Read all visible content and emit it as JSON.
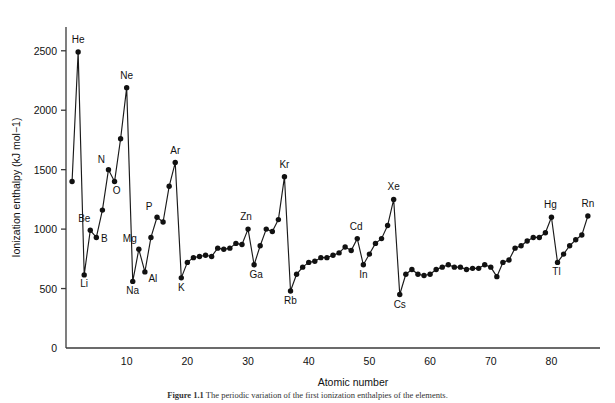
{
  "figure": {
    "caption_label": "Figure 1.1",
    "caption_text": "The periodic variation of the first ionization enthalpies of the elements."
  },
  "chart_data": {
    "type": "line",
    "title": "",
    "xlabel": "Atomic number",
    "ylabel": "Ionization enthalpy (kJ mol−1)",
    "xlim": [
      0,
      88
    ],
    "ylim": [
      0,
      2700
    ],
    "grid": false,
    "legend": "none",
    "xticks": [
      10,
      20,
      30,
      40,
      50,
      60,
      70,
      80
    ],
    "yticks": [
      0,
      500,
      1000,
      1500,
      2000,
      2500
    ],
    "y_origin_label": "0",
    "x": [
      1,
      2,
      3,
      4,
      5,
      6,
      7,
      8,
      9,
      10,
      11,
      12,
      13,
      14,
      15,
      16,
      17,
      18,
      19,
      20,
      21,
      22,
      23,
      24,
      25,
      26,
      27,
      28,
      29,
      30,
      31,
      32,
      33,
      34,
      35,
      36,
      37,
      38,
      39,
      40,
      41,
      42,
      43,
      44,
      45,
      46,
      47,
      48,
      49,
      50,
      51,
      52,
      53,
      54,
      55,
      56,
      57,
      58,
      59,
      60,
      61,
      62,
      63,
      64,
      65,
      66,
      67,
      68,
      69,
      70,
      71,
      72,
      73,
      74,
      75,
      76,
      77,
      78,
      79,
      80,
      81,
      82,
      83,
      84,
      85,
      86
    ],
    "values": [
      1400,
      2490,
      615,
      990,
      930,
      1160,
      1500,
      1400,
      1760,
      2190,
      560,
      830,
      640,
      930,
      1100,
      1060,
      1360,
      1560,
      590,
      720,
      760,
      770,
      780,
      770,
      840,
      830,
      840,
      880,
      870,
      1000,
      700,
      860,
      1000,
      980,
      1080,
      1440,
      480,
      620,
      680,
      720,
      730,
      760,
      760,
      780,
      800,
      850,
      820,
      920,
      700,
      790,
      880,
      920,
      1030,
      1250,
      450,
      620,
      660,
      620,
      610,
      620,
      660,
      680,
      700,
      680,
      680,
      660,
      670,
      670,
      700,
      680,
      600,
      720,
      740,
      840,
      860,
      900,
      930,
      930,
      970,
      1100,
      720,
      790,
      860,
      910,
      950,
      1110
    ],
    "series_name": "First ionization enthalpy",
    "point_labels": [
      {
        "x": 2,
        "text": "He"
      },
      {
        "x": 3,
        "text": "Li"
      },
      {
        "x": 4,
        "text": "Be"
      },
      {
        "x": 5,
        "text": "B"
      },
      {
        "x": 7,
        "text": "N"
      },
      {
        "x": 8,
        "text": "O"
      },
      {
        "x": 10,
        "text": "Ne"
      },
      {
        "x": 11,
        "text": "Na"
      },
      {
        "x": 12,
        "text": "Mg"
      },
      {
        "x": 13,
        "text": "Al"
      },
      {
        "x": 15,
        "text": "P"
      },
      {
        "x": 18,
        "text": "Ar"
      },
      {
        "x": 19,
        "text": "K"
      },
      {
        "x": 30,
        "text": "Zn"
      },
      {
        "x": 31,
        "text": "Ga"
      },
      {
        "x": 36,
        "text": "Kr"
      },
      {
        "x": 37,
        "text": "Rb"
      },
      {
        "x": 48,
        "text": "Cd"
      },
      {
        "x": 49,
        "text": "In"
      },
      {
        "x": 54,
        "text": "Xe"
      },
      {
        "x": 55,
        "text": "Cs"
      },
      {
        "x": 80,
        "text": "Hg"
      },
      {
        "x": 81,
        "text": "Tl"
      },
      {
        "x": 86,
        "text": "Rn"
      }
    ],
    "label_offsets": {
      "He": [
        0,
        -9
      ],
      "Li": [
        0,
        12
      ],
      "Be": [
        -6,
        -8
      ],
      "B": [
        8,
        5
      ],
      "N": [
        -7,
        -7
      ],
      "O": [
        2,
        12
      ],
      "Ne": [
        0,
        -9
      ],
      "Na": [
        0,
        13
      ],
      "Mg": [
        -9,
        -7
      ],
      "Al": [
        8,
        10
      ],
      "P": [
        -8,
        -7
      ],
      "Ar": [
        0,
        -9
      ],
      "K": [
        0,
        13
      ],
      "Zn": [
        -2,
        -9
      ],
      "Ga": [
        2,
        13
      ],
      "Kr": [
        0,
        -9
      ],
      "Rb": [
        0,
        13
      ],
      "Cd": [
        -1,
        -9
      ],
      "In": [
        0,
        13
      ],
      "Xe": [
        0,
        -9
      ],
      "Cs": [
        0,
        13
      ],
      "Hg": [
        -1,
        -9
      ],
      "Tl": [
        -1,
        13
      ],
      "Rn": [
        0,
        -9
      ]
    }
  }
}
